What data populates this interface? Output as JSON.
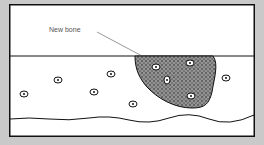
{
  "diagram": {
    "label": "New bone",
    "colors": {
      "background": "#c9c9c9",
      "panel": "#ffffff",
      "stroke": "#111111",
      "bone_fill": "#555555"
    },
    "cells": [
      {
        "cx": 24,
        "cy": 94
      },
      {
        "cx": 58,
        "cy": 80
      },
      {
        "cx": 111,
        "cy": 74
      },
      {
        "cx": 94,
        "cy": 92
      },
      {
        "cx": 133,
        "cy": 104
      },
      {
        "cx": 226,
        "cy": 78
      }
    ],
    "bone_cells": [
      {
        "cx": 156,
        "cy": 67
      },
      {
        "cx": 190,
        "cy": 63
      },
      {
        "cx": 167,
        "cy": 80
      },
      {
        "cx": 191,
        "cy": 96
      }
    ]
  }
}
